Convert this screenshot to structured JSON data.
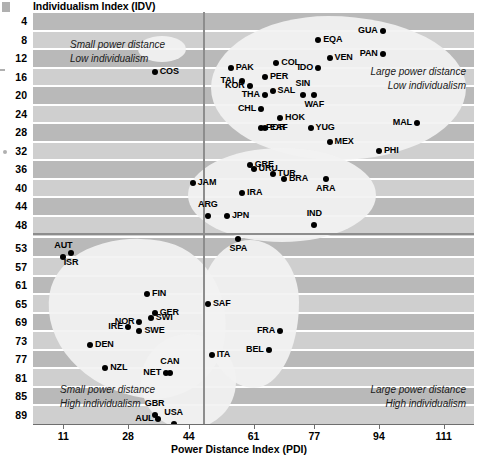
{
  "chart_data": {
    "type": "scatter",
    "title": "",
    "ylabel": "Individualism Index (IDV)",
    "xlabel": "Power Distance Index (PDI)",
    "xticks": [
      11,
      28,
      44,
      61,
      77,
      94,
      111
    ],
    "yticks": [
      4,
      8,
      12,
      16,
      20,
      24,
      28,
      32,
      36,
      40,
      44,
      48,
      53,
      57,
      61,
      65,
      69,
      73,
      77,
      81,
      85,
      89
    ],
    "xlim": [
      3,
      119
    ],
    "ylim": [
      2,
      91
    ],
    "y_axis_inverted": true,
    "grid": true,
    "legend_position": "none",
    "divider_x": 48,
    "divider_y": 50,
    "points": [
      {
        "label": "COS",
        "x": 35,
        "y": 15,
        "label_side": "r"
      },
      {
        "label": "EQA",
        "x": 78,
        "y": 8,
        "label_side": "r"
      },
      {
        "label": "GUA",
        "x": 95,
        "y": 6,
        "label_side": "l"
      },
      {
        "label": "COL",
        "x": 67,
        "y": 13,
        "label_side": "r"
      },
      {
        "label": "VEN",
        "x": 81,
        "y": 12,
        "label_side": "r"
      },
      {
        "label": "PAN",
        "x": 95,
        "y": 11,
        "label_side": "l"
      },
      {
        "label": "PAK",
        "x": 55,
        "y": 14,
        "label_side": "r"
      },
      {
        "label": "IDO",
        "x": 78,
        "y": 14,
        "label_side": "l"
      },
      {
        "label": "TAL",
        "x": 58,
        "y": 17,
        "label_side": "l"
      },
      {
        "label": "PER",
        "x": 64,
        "y": 16,
        "label_side": "r"
      },
      {
        "label": "KOR",
        "x": 60,
        "y": 18,
        "label_side": "l"
      },
      {
        "label": "SIN",
        "x": 74,
        "y": 20,
        "label_side": "t"
      },
      {
        "label": "THA",
        "x": 64,
        "y": 20,
        "label_side": "l"
      },
      {
        "label": "SAL",
        "x": 66,
        "y": 19,
        "label_side": "r"
      },
      {
        "label": "WAF",
        "x": 77,
        "y": 20,
        "label_side": "b"
      },
      {
        "label": "CHL",
        "x": 63,
        "y": 23,
        "label_side": "l"
      },
      {
        "label": "HOK",
        "x": 68,
        "y": 25,
        "label_side": "r"
      },
      {
        "label": "POR",
        "x": 63,
        "y": 27,
        "label_side": "r"
      },
      {
        "label": "YUG",
        "x": 76,
        "y": 27,
        "label_side": "r"
      },
      {
        "label": "MAL",
        "x": 104,
        "y": 26,
        "label_side": "l"
      },
      {
        "label": "EAF",
        "x": 64,
        "y": 27,
        "label_side": "r"
      },
      {
        "label": "MEX",
        "x": 81,
        "y": 30,
        "label_side": "r"
      },
      {
        "label": "PHI",
        "x": 94,
        "y": 32,
        "label_side": "r"
      },
      {
        "label": "GRE",
        "x": 60,
        "y": 35,
        "label_side": "r"
      },
      {
        "label": "URU",
        "x": 61,
        "y": 36,
        "label_side": "r"
      },
      {
        "label": "TUR",
        "x": 66,
        "y": 37,
        "label_side": "r"
      },
      {
        "label": "JAM",
        "x": 45,
        "y": 39,
        "label_side": "r"
      },
      {
        "label": "BRA",
        "x": 69,
        "y": 38,
        "label_side": "r"
      },
      {
        "label": "ARA",
        "x": 80,
        "y": 38,
        "label_side": "b"
      },
      {
        "label": "IRA",
        "x": 58,
        "y": 41,
        "label_side": "r"
      },
      {
        "label": "ARG",
        "x": 49,
        "y": 46,
        "label_side": "t"
      },
      {
        "label": "JPN",
        "x": 54,
        "y": 46,
        "label_side": "r"
      },
      {
        "label": "IND",
        "x": 77,
        "y": 48,
        "label_side": "t"
      },
      {
        "label": "AUT",
        "x": 11,
        "y": 55,
        "label_side": "t"
      },
      {
        "label": "ISR",
        "x": 13,
        "y": 54,
        "label_side": "b"
      },
      {
        "label": "SPA",
        "x": 57,
        "y": 51,
        "label_side": "b"
      },
      {
        "label": "FIN",
        "x": 33,
        "y": 63,
        "label_side": "r"
      },
      {
        "label": "GER",
        "x": 35,
        "y": 67,
        "label_side": "r"
      },
      {
        "label": "SAF",
        "x": 49,
        "y": 65,
        "label_side": "r"
      },
      {
        "label": "NOR",
        "x": 31,
        "y": 69,
        "label_side": "l"
      },
      {
        "label": "SWI",
        "x": 34,
        "y": 68,
        "label_side": "r"
      },
      {
        "label": "IRE",
        "x": 28,
        "y": 70,
        "label_side": "l"
      },
      {
        "label": "SWE",
        "x": 31,
        "y": 71,
        "label_side": "r"
      },
      {
        "label": "FRA",
        "x": 68,
        "y": 71,
        "label_side": "l"
      },
      {
        "label": "BEL",
        "x": 65,
        "y": 75,
        "label_side": "l"
      },
      {
        "label": "DEN",
        "x": 18,
        "y": 74,
        "label_side": "r"
      },
      {
        "label": "ITA",
        "x": 50,
        "y": 76,
        "label_side": "r"
      },
      {
        "label": "NZL",
        "x": 22,
        "y": 79,
        "label_side": "r"
      },
      {
        "label": "CAN",
        "x": 39,
        "y": 80,
        "label_side": "t"
      },
      {
        "label": "NET",
        "x": 38,
        "y": 80,
        "label_side": "l"
      },
      {
        "label": "GBR",
        "x": 35,
        "y": 89,
        "label_side": "t"
      },
      {
        "label": "AUL",
        "x": 36,
        "y": 90,
        "label_side": "l"
      },
      {
        "label": "USA",
        "x": 40,
        "y": 91,
        "label_side": "t"
      }
    ],
    "annotations": [
      {
        "id": "quad-tl",
        "lines": [
          "Small power distance",
          "Low individualism"
        ]
      },
      {
        "id": "quad-tr",
        "lines": [
          "Large power distance",
          "Low individualism"
        ]
      },
      {
        "id": "quad-bl",
        "lines": [
          "Small power distance",
          "High individualism"
        ]
      },
      {
        "id": "quad-br",
        "lines": [
          "Large power distance",
          "High individualism"
        ]
      }
    ],
    "clusters": [
      {
        "id": "blob-cos",
        "members": [
          "COS"
        ]
      },
      {
        "id": "blob-big",
        "members": [
          "EQA",
          "GUA",
          "COL",
          "VEN",
          "PAN",
          "PAK",
          "IDO",
          "TAL",
          "PER",
          "KOR",
          "SIN",
          "THA",
          "SAL",
          "WAF",
          "CHL",
          "HOK",
          "POR",
          "YUG",
          "MAL",
          "EAF",
          "MEX",
          "PHI"
        ]
      },
      {
        "id": "blob-mid",
        "members": [
          "GRE",
          "URU",
          "TUR",
          "JAM",
          "BRA",
          "ARA",
          "IRA",
          "ARG",
          "JPN",
          "IND"
        ]
      },
      {
        "id": "blob-west",
        "members": [
          "AUT",
          "ISR",
          "FIN",
          "GER",
          "NOR",
          "SWI",
          "IRE",
          "SWE",
          "DEN",
          "NZL"
        ]
      },
      {
        "id": "blob-anglo",
        "members": [
          "CAN",
          "NET",
          "GBR",
          "AUL",
          "USA"
        ]
      },
      {
        "id": "blob-latin",
        "members": [
          "SPA",
          "SAF",
          "FRA",
          "BEL",
          "ITA"
        ]
      }
    ],
    "colors": {
      "plot_band_dark": "#b9b9b9",
      "plot_band_light": "#cfcfcf",
      "gridline": "#ffffff",
      "cluster_fill": "#f2f2f2",
      "divider": "#8d8d8d",
      "point": "#000000",
      "text": "#000000"
    }
  },
  "quad_tl_line1": "Small power distance",
  "quad_tl_line2": "Low individualism",
  "quad_tr_line1": "Large power distance",
  "quad_tr_line2": "Low individualism",
  "quad_bl_line1": "Small power distance",
  "quad_bl_line2": "High individualism",
  "quad_br_line1": "Large power distance",
  "quad_br_line2": "High individualism"
}
